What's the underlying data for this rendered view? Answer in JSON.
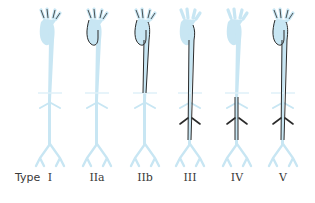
{
  "diagram": {
    "type_label": "Type",
    "colors": {
      "vessel_fill": "#c8e6f3",
      "vessel_fill_light": "#dff0f8",
      "outline": "#2b2b2b",
      "label_text": "#3a3a3a",
      "background": "#ffffff"
    },
    "types": [
      {
        "id": "I",
        "label": "I",
        "center_x": 50,
        "extent": "arch-branches-only"
      },
      {
        "id": "IIa",
        "label": "IIa",
        "center_x": 97,
        "extent": "ascending-aorta-and-arch"
      },
      {
        "id": "IIb",
        "label": "IIb",
        "center_x": 145,
        "extent": "arch-and-descending-thoracic"
      },
      {
        "id": "III",
        "label": "III",
        "center_x": 190,
        "extent": "descending-thoracic-and-abdominal"
      },
      {
        "id": "IV",
        "label": "IV",
        "center_x": 237,
        "extent": "abdominal-aorta"
      },
      {
        "id": "V",
        "label": "V",
        "center_x": 283,
        "extent": "entire-aorta"
      }
    ]
  }
}
